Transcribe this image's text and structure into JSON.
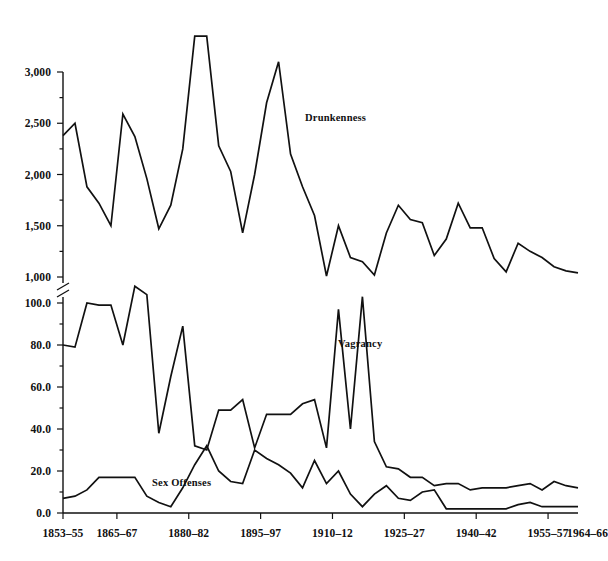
{
  "chart_data": {
    "type": "line",
    "title": "",
    "xlabel": "",
    "ylabel": "",
    "grid": false,
    "legend_position": "inline-annotations",
    "axis_break": {
      "present": true,
      "between": [
        1000,
        100.0
      ],
      "symbol": "double-slash"
    },
    "x_tick_labels": [
      "1853–55",
      "1865–67",
      "1880–82",
      "1895–97",
      "1910–12",
      "1925–27",
      "1940–42",
      "1955–57",
      "1964–66"
    ],
    "y_axis_upper": {
      "tick_labels": [
        "1,000",
        "1,500",
        "2,000",
        "2,500",
        "3,000"
      ],
      "values": [
        1000,
        1500,
        2000,
        2500,
        3000
      ],
      "range": [
        1000,
        3400
      ]
    },
    "y_axis_lower": {
      "tick_labels": [
        "0.0",
        "20.0",
        "40.0",
        "60.0",
        "80.0",
        "100.0"
      ],
      "values": [
        0,
        20,
        40,
        60,
        80,
        100
      ],
      "range": [
        0,
        110
      ]
    },
    "series": [
      {
        "name": "Drunkenness",
        "scale": "upper",
        "label_text": "Drunkenness",
        "values": [
          2380,
          2500,
          1880,
          1720,
          1500,
          2590,
          2370,
          1960,
          1470,
          1700,
          2250,
          3350,
          3350,
          2280,
          2030,
          1430,
          2000,
          2700,
          3100,
          2200,
          1880,
          1600,
          1010,
          1500,
          1190,
          1150,
          1020,
          1430,
          1700,
          1560,
          1530,
          1210,
          1370,
          1720,
          1480,
          1480,
          1180,
          1050,
          1330,
          1250,
          1190,
          1100,
          1060,
          1040
        ]
      },
      {
        "name": "Vagrancy",
        "scale": "lower",
        "label_text": "Vagrancy",
        "values": [
          80,
          79,
          100,
          99,
          99,
          80,
          108,
          104,
          38,
          65,
          89,
          32,
          30,
          49,
          49,
          54,
          31,
          47,
          47,
          47,
          52,
          54,
          31,
          97,
          40,
          103,
          34,
          22,
          21,
          17,
          17,
          13,
          14,
          14,
          11,
          12,
          12,
          12,
          13,
          14,
          11,
          15,
          13,
          12
        ]
      },
      {
        "name": "Sex Offenses",
        "scale": "lower",
        "label_text": "Sex Offenses",
        "values": [
          7,
          8,
          11,
          17,
          17,
          17,
          17,
          8,
          5,
          3,
          12,
          23,
          32,
          20,
          15,
          14,
          30,
          26,
          23,
          19,
          12,
          25,
          14,
          20,
          9,
          3,
          9,
          13,
          7,
          6,
          10,
          11,
          2,
          2,
          2,
          2,
          2,
          2,
          4,
          5,
          3,
          3,
          3,
          3
        ]
      }
    ],
    "colors": {
      "line": "#111111",
      "axis": "#111111",
      "background": "#ffffff"
    }
  },
  "geometry": {
    "plot_left": 63,
    "plot_right": 578,
    "axis_top": 72,
    "break_upper_y": 277,
    "break_lower_y": 303,
    "baseline_y": 513,
    "upper_top_value": 3400,
    "n_points": 44
  }
}
